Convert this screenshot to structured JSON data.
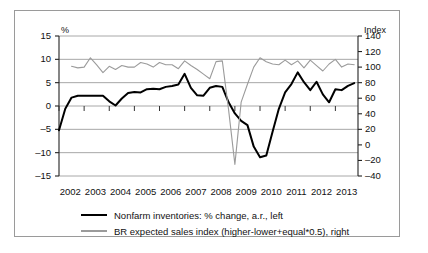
{
  "figure": {
    "left_axis_title": "%",
    "right_axis_title": "Index"
  },
  "legend": {
    "items": [
      {
        "label": "Nonfarm inventories: % change, a.r., left",
        "color": "#000000",
        "style": "thick-black"
      },
      {
        "label": "BR expected sales index (higher-lower+equal*0.5), right",
        "color": "#9b9b9b",
        "style": "thin-gray"
      }
    ]
  },
  "chart_data": {
    "type": "line",
    "title": "",
    "subtitle": "",
    "xlabel": "",
    "ylabel": "%",
    "y2label": "Index",
    "grid": true,
    "legend_position": "bottom",
    "xlim": [
      2002.0,
      2013.9
    ],
    "ylim": [
      -15,
      15
    ],
    "y2lim": [
      -40,
      140
    ],
    "yticks": [
      15,
      10,
      5,
      0,
      -5,
      -10,
      -15
    ],
    "y2ticks": [
      140,
      120,
      100,
      80,
      60,
      40,
      20,
      0,
      -20,
      -40
    ],
    "xticks": [
      2002,
      2003,
      2004,
      2005,
      2006,
      2007,
      2008,
      2009,
      2010,
      2011,
      2012,
      2013
    ],
    "xtick_labels": [
      "2002",
      "2003",
      "2004",
      "2005",
      "2006",
      "2007",
      "2008",
      "2009",
      "2010",
      "2011",
      "2012",
      "2013"
    ],
    "series": [
      {
        "name": "Nonfarm inventories: % change, a.r., left",
        "axis": "left",
        "color": "#000000",
        "width": 2.0,
        "x": [
          2002.0,
          2002.25,
          2002.5,
          2002.75,
          2003.0,
          2003.25,
          2003.5,
          2003.75,
          2004.0,
          2004.25,
          2004.5,
          2004.75,
          2005.0,
          2005.25,
          2005.5,
          2005.75,
          2006.0,
          2006.25,
          2006.5,
          2006.75,
          2007.0,
          2007.25,
          2007.5,
          2007.75,
          2008.0,
          2008.25,
          2008.5,
          2008.75,
          2009.0,
          2009.25,
          2009.5,
          2009.75,
          2010.0,
          2010.25,
          2010.5,
          2010.75,
          2011.0,
          2011.25,
          2011.5,
          2011.75,
          2012.0,
          2012.25,
          2012.5,
          2012.75,
          2013.0,
          2013.25,
          2013.5,
          2013.75
        ],
        "values": [
          -5.2,
          -0.6,
          1.8,
          2.2,
          2.2,
          2.2,
          2.2,
          2.2,
          1.0,
          0.1,
          1.6,
          2.8,
          3.0,
          2.9,
          3.6,
          3.7,
          3.6,
          4.1,
          4.3,
          4.6,
          6.9,
          3.9,
          2.3,
          2.2,
          3.9,
          4.3,
          4.1,
          0.8,
          -1.6,
          -3.2,
          -4.1,
          -8.7,
          -11.0,
          -10.6,
          -5.5,
          -0.6,
          2.9,
          4.7,
          7.2,
          5.1,
          3.4,
          5.2,
          2.5,
          0.8,
          3.6,
          3.4,
          4.3,
          4.9
        ]
      },
      {
        "name": "BR expected sales index (higher-lower+equal*0.5), right",
        "axis": "right",
        "color": "#9b9b9b",
        "width": 1.1,
        "x": [
          2002.5,
          2002.75,
          2003.0,
          2003.25,
          2003.5,
          2003.75,
          2004.0,
          2004.25,
          2004.5,
          2004.75,
          2005.0,
          2005.25,
          2005.5,
          2005.75,
          2006.0,
          2006.25,
          2006.5,
          2006.75,
          2007.0,
          2007.25,
          2007.5,
          2007.75,
          2008.0,
          2008.25,
          2008.5,
          2008.75,
          2009.0,
          2009.25,
          2009.5,
          2009.75,
          2010.0,
          2010.25,
          2010.5,
          2010.75,
          2011.0,
          2011.25,
          2011.5,
          2011.75,
          2012.0,
          2012.25,
          2012.5,
          2012.75,
          2013.0,
          2013.25,
          2013.5,
          2013.75
        ],
        "values": [
          101,
          99,
          100,
          112,
          103,
          93,
          101,
          97,
          102,
          100,
          100,
          106,
          104,
          100,
          106,
          103,
          103,
          98,
          108,
          102,
          97,
          91,
          85,
          107,
          108,
          45,
          -25,
          55,
          78,
          100,
          112,
          107,
          104,
          103,
          109,
          103,
          108,
          99,
          109,
          102,
          95,
          104,
          110,
          100,
          104,
          103
        ]
      }
    ]
  }
}
